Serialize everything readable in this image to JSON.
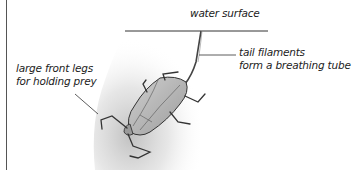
{
  "diagram": {
    "labels": {
      "surface": "water surface",
      "tail_line1": "tail filaments",
      "tail_line2": "form a breathing tube",
      "legs_line1": "large front legs",
      "legs_line2": "for holding prey"
    },
    "colors": {
      "ink": "#333333",
      "shadow": "#c8c8c8",
      "body_fill": "#bdbdbd",
      "background": "#ffffff"
    }
  }
}
